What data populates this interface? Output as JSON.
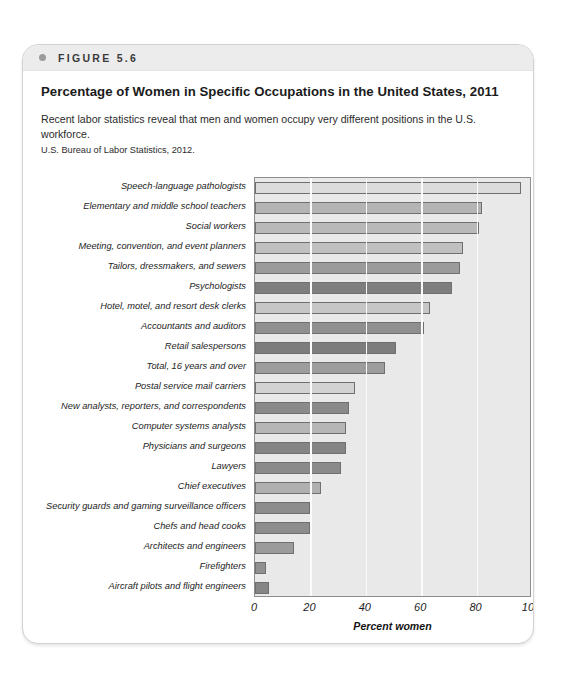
{
  "figure": {
    "number_label": "FIGURE 5.6",
    "title": "Percentage of Women in Specific Occupations in the United States, 2011",
    "caption": "Recent labor statistics reveal that men and women occupy very different positions in the U.S. workforce.",
    "source": "U.S. Bureau of Labor Statistics, 2012."
  },
  "chart_data": {
    "type": "bar",
    "orientation": "horizontal",
    "title": "Percentage of Women in Specific Occupations in the United States, 2011",
    "xlabel": "Percent women",
    "ylabel": "",
    "xlim": [
      0,
      100
    ],
    "xticks": [
      0,
      20,
      40,
      60,
      80,
      100
    ],
    "grid": true,
    "grid_axis": "x",
    "legend": "none",
    "categories": [
      "Speech-language pathologists",
      "Elementary and middle school teachers",
      "Social workers",
      "Meeting, convention, and event planners",
      "Tailors, dressmakers, and sewers",
      "Psychologists",
      "Hotel, motel, and resort desk clerks",
      "Accountants and auditors",
      "Retail salespersons",
      "Total, 16 years and over",
      "Postal service mail carriers",
      "New analysts, reporters, and correspondents",
      "Computer systems analysts",
      "Physicians and surgeons",
      "Lawyers",
      "Chief executives",
      "Security guards and gaming surveillance officers",
      "Chefs and head cooks",
      "Architects and engineers",
      "Firefighters",
      "Aircraft pilots and flight engineers"
    ],
    "values": [
      96,
      82,
      81,
      75,
      74,
      71,
      63,
      61,
      51,
      47,
      36,
      34,
      33,
      33,
      31,
      24,
      20,
      20,
      14,
      4,
      5
    ],
    "bar_colors": [
      "#dcdcdc",
      "#b4b4b4",
      "#b9b9b9",
      "#c0c0c0",
      "#9b9b9b",
      "#7e7e7e",
      "#c6c6c6",
      "#8f8f8f",
      "#7d7d7d",
      "#9d9d9d",
      "#d2d2d2",
      "#8a8a8a",
      "#b6b6b6",
      "#858585",
      "#8a8a8a",
      "#b0b0b0",
      "#8d8d8d",
      "#8d8d8d",
      "#9b9b9b",
      "#909090",
      "#868686"
    ],
    "plot_background": "#e9e9e9",
    "gridline_color": "#fbfbfb",
    "axis_color": "#8e8e8e"
  }
}
